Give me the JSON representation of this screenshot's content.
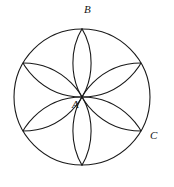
{
  "figure": {
    "kind": "geometric-diagram",
    "background_color": "#ffffff",
    "stroke_color": "#1a1a1a",
    "canvas": {
      "width": 174,
      "height": 187
    }
  },
  "main_circle": {
    "name": "outer-circle",
    "center_x": 82,
    "center_y": 97,
    "radius": 68,
    "stroke_width": 1.1
  },
  "petal_arcs": {
    "name": "six-petal-rosette",
    "count": 6,
    "radius": 68,
    "stroke_width": 1.1,
    "centers": [
      {
        "angle_deg": 90,
        "x": 82,
        "y": 29
      },
      {
        "angle_deg": 30,
        "x": 140.9,
        "y": 63
      },
      {
        "angle_deg": -30,
        "x": 140.9,
        "y": 131
      },
      {
        "angle_deg": -90,
        "x": 82,
        "y": 165
      },
      {
        "angle_deg": -150,
        "x": 23.1,
        "y": 131
      },
      {
        "angle_deg": 150,
        "x": 23.1,
        "y": 63
      }
    ]
  },
  "labels": {
    "A": {
      "text": "A",
      "x": 72,
      "y": 99,
      "meaning": "center-point"
    },
    "B": {
      "text": "B",
      "x": 84,
      "y": 4,
      "meaning": "top-circle-point"
    },
    "C": {
      "text": "C",
      "x": 150,
      "y": 130,
      "meaning": "lower-right-circle-point"
    }
  }
}
